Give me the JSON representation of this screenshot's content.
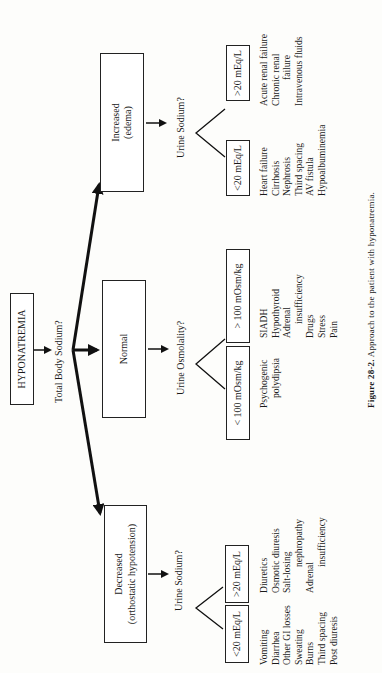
{
  "root": {
    "label": "HYPONATREMIA"
  },
  "question_total_body_sodium": "Total Body Sodium?",
  "branches": {
    "decreased": {
      "box_line1": "Decreased",
      "box_line2": "(orthostatic hypotension)",
      "question": "Urine Sodium?",
      "low": {
        "label": "<20 mEq/L",
        "causes": [
          "Vomiting",
          "Diarrhea",
          "Other GI losses",
          "Sweating",
          "Burns",
          "Third spacing",
          "Post diuresis"
        ]
      },
      "high": {
        "label": ">20 mEq/L",
        "causes": [
          {
            "text": "Diuretics",
            "indent": false
          },
          {
            "text": "Osmotic diuresis",
            "indent": false
          },
          {
            "text": "Salt-losing",
            "indent": false
          },
          {
            "text": "nephropathy",
            "indent": true
          },
          {
            "text": "Adrenal",
            "indent": false
          },
          {
            "text": "insufficiency",
            "indent": true
          }
        ]
      }
    },
    "normal": {
      "box_line1": "Normal",
      "question": "Urine Osmolality?",
      "low": {
        "label": "< 100 mOsm/kg",
        "causes": [
          {
            "text": "Psychogenic",
            "indent": false
          },
          {
            "text": "polydipsia",
            "indent": true
          }
        ]
      },
      "high": {
        "label": "> 100 mOsm/kg",
        "causes": [
          {
            "text": "SIADH",
            "indent": false
          },
          {
            "text": "Hypothyroid",
            "indent": false
          },
          {
            "text": "Adrenal",
            "indent": false
          },
          {
            "text": "insufficiency",
            "indent": true
          },
          {
            "text": "Drugs",
            "indent": false
          },
          {
            "text": "Stress",
            "indent": false
          },
          {
            "text": "Pain",
            "indent": false
          }
        ]
      }
    },
    "increased": {
      "box_line1": "Increased",
      "box_line2": "(edema)",
      "question": "Urine Sodium?",
      "low": {
        "label": "<20 mEq/L",
        "causes": [
          "Heart failure",
          "Cirrhosis",
          "Nephrosis",
          "Third spacing",
          "AV fistula",
          "Hypoalbuminemia"
        ]
      },
      "high": {
        "label": ">20 mEq/L",
        "causes": [
          {
            "text": "Acute renal failure",
            "indent": false
          },
          {
            "text": "Chronic renal",
            "indent": false
          },
          {
            "text": "failure",
            "indent": true
          },
          {
            "text": "Intravenous fluids",
            "indent": false
          }
        ]
      }
    }
  },
  "caption": {
    "figure": "Figure 28-2.",
    "text": "Approach to the patient with hyponatremia."
  }
}
